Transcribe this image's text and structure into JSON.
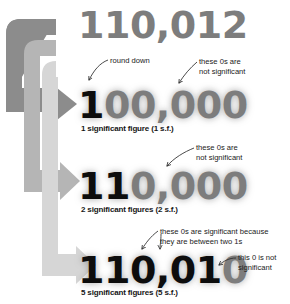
{
  "diagram": {
    "title_concept": "significant figures rounding",
    "colors": {
      "arrow_dark": "#8c8c8c",
      "arrow_mid": "#b5b5b5",
      "arrow_light": "#d6d6d6",
      "digit_significant": "#0d0d0d",
      "digit_not_significant": "#7d7d7d",
      "annotation_text": "#1a1a1a",
      "background": "#ffffff"
    },
    "numbers": [
      {
        "id": "original",
        "full": "110,012",
        "significant_part": "",
        "nonsignificant_part": "110,012",
        "caption": ""
      },
      {
        "id": "one-sf",
        "full": "100,000",
        "significant_part": "1",
        "nonsignificant_part": "00,000",
        "caption": "1 significant figure (1 s.f.)"
      },
      {
        "id": "two-sf",
        "full": "110,000",
        "significant_part": "11",
        "nonsignificant_part": "0,000",
        "caption": "2 significant figures (2 s.f.)"
      },
      {
        "id": "five-sf",
        "full": "110,010",
        "significant_part": "110,01",
        "nonsignificant_part": "0",
        "caption": "5 significant figures (5 s.f.)"
      }
    ],
    "annotations": [
      {
        "id": "round-down",
        "lines": [
          "round down"
        ]
      },
      {
        "id": "zeros-not-significant-1",
        "lines": [
          "these 0s are",
          "not significant"
        ]
      },
      {
        "id": "zeros-not-significant-2",
        "lines": [
          "these 0s are",
          "not significant"
        ]
      },
      {
        "id": "zeros-significant-between",
        "lines": [
          "these 0s are significant because",
          "they are between two 1s"
        ]
      },
      {
        "id": "this-zero-not-significant",
        "lines": [
          "this 0 is not",
          "significant"
        ]
      }
    ],
    "arrows": [
      {
        "id": "arrow-to-1sf",
        "shade": "dark"
      },
      {
        "id": "arrow-to-2sf",
        "shade": "mid"
      },
      {
        "id": "arrow-to-5sf",
        "shade": "light"
      }
    ]
  }
}
